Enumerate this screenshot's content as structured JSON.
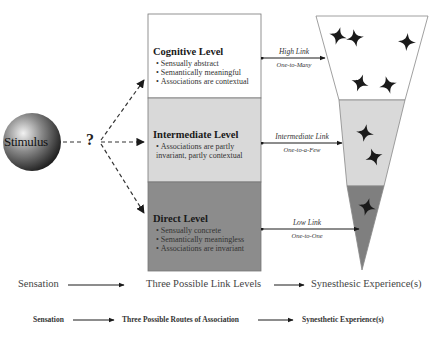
{
  "stimulus": {
    "label": "Stimulus",
    "question_mark": "?"
  },
  "levels": [
    {
      "title": "Cognitive Level",
      "bullets": [
        "Sensually abstract",
        "Semantically meaningful",
        "Associations are contextual"
      ],
      "fill": "#ffffff"
    },
    {
      "title": "Intermediate Level",
      "bullets": [
        "Associations are partly invariant, partly contextual"
      ],
      "fill": "#d9d9d9"
    },
    {
      "title": "Direct Level",
      "bullets": [
        "Sensually concrete",
        "Semantically meaningless",
        "Associations are invariant"
      ],
      "fill": "#8c8c8c"
    }
  ],
  "links": [
    {
      "label": "High Link",
      "sublabel": "One-to-Many"
    },
    {
      "label": "Intermediate Link",
      "sublabel": "One-to-a-Few"
    },
    {
      "label": "Low Link",
      "sublabel": "One-to-One"
    }
  ],
  "funnel": {
    "bands": [
      {
        "name": "high",
        "fill": "#ffffff",
        "star_count": 5
      },
      {
        "name": "intermediate",
        "fill": "#d9d9d9",
        "star_count": 2
      },
      {
        "name": "low",
        "fill": "#7f7f7f",
        "star_count": 1
      }
    ]
  },
  "captions": {
    "row1": [
      "Sensation",
      "Three Possible Link Levels",
      "Synesthesic Experience(s)"
    ],
    "row2": [
      "Sensation",
      "Three Possible Routes of Association",
      "Synesthetic Experience(s)"
    ]
  }
}
